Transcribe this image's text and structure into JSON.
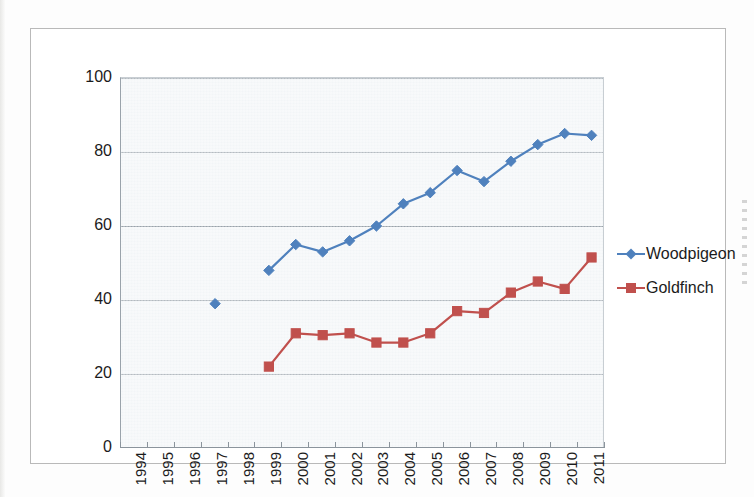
{
  "chart_data": {
    "type": "line",
    "title": "",
    "xlabel": "",
    "ylabel": "",
    "ylim": [
      0,
      100
    ],
    "ytick_step": 20,
    "yticks": [
      "100",
      "80",
      "60",
      "40",
      "20",
      "0"
    ],
    "grid": true,
    "legend_position": "right",
    "categories": [
      "1994",
      "1995",
      "1996",
      "1997",
      "1998",
      "1999",
      "2000",
      "2001",
      "2002",
      "2003",
      "2004",
      "2005",
      "2006",
      "2007",
      "2008",
      "2009",
      "2010",
      "2011"
    ],
    "series": [
      {
        "name": "Woodpigeon",
        "color": "#4F81BD",
        "marker": "diamond",
        "values": [
          null,
          null,
          null,
          39,
          null,
          48,
          55,
          53,
          56,
          60,
          66,
          69,
          75,
          72,
          77.5,
          82,
          85,
          84.5
        ]
      },
      {
        "name": "Goldfinch",
        "color": "#C0504D",
        "marker": "square",
        "values": [
          null,
          null,
          null,
          null,
          null,
          22,
          31,
          30.5,
          31,
          28.5,
          28.5,
          31,
          37,
          36.5,
          42,
          45,
          43,
          51.5
        ]
      }
    ]
  },
  "legend": {
    "items": [
      {
        "label": "Woodpigeon",
        "color": "#4F81BD",
        "marker": "diamond"
      },
      {
        "label": "Goldfinch",
        "color": "#C0504D",
        "marker": "square"
      }
    ]
  },
  "colors": {
    "woodpigeon": "#4F81BD",
    "goldfinch": "#C0504D",
    "plot_background": "#f2f5f7",
    "gridline": "#9aa3ab",
    "frame_border": "#b9b9b9"
  }
}
